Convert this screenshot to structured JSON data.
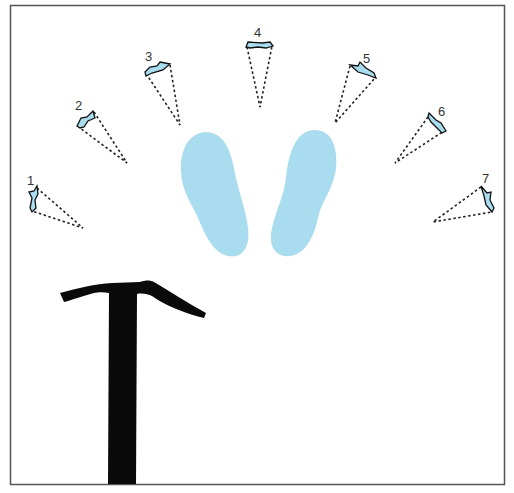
{
  "diagram": {
    "colors": {
      "border": "#555555",
      "footprint": "#a9dcef",
      "pick_fill": "#a9dcef",
      "pick_outline": "#111111",
      "dash": "#222222",
      "axe": "#0a0a0a",
      "label": "#333333"
    },
    "positions": [
      {
        "label": "1"
      },
      {
        "label": "2"
      },
      {
        "label": "3"
      },
      {
        "label": "4"
      },
      {
        "label": "5"
      },
      {
        "label": "6"
      },
      {
        "label": "7"
      }
    ],
    "footprints": [
      "left-foot",
      "right-foot"
    ],
    "tool": "ice-axe"
  }
}
